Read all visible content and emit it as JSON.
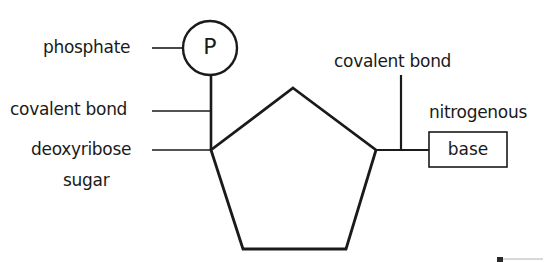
{
  "diagram": {
    "phosphate": {
      "symbol": "P",
      "label": "phosphate"
    },
    "labels": {
      "phosphate": "phosphate",
      "covalent_bond_left": "covalent bond",
      "deoxyribose_line1": "deoxyribose",
      "deoxyribose_line2": "sugar",
      "covalent_bond_right": "covalent bond",
      "nitrogenous": "nitrogenous",
      "base": "base"
    },
    "colors": {
      "stroke": "#1a1a1a",
      "background": "#ffffff"
    }
  }
}
